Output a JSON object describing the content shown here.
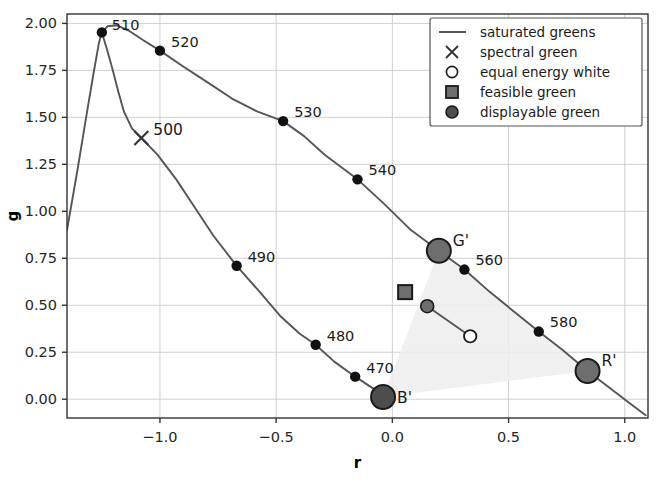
{
  "chart_data": {
    "type": "line",
    "title": "",
    "xlabel": "r",
    "ylabel": "g",
    "xlim": [
      -1.4,
      1.1
    ],
    "ylim": [
      -0.1,
      2.05
    ],
    "grid": true,
    "legend_position": "upper right",
    "xticks": [
      -1.0,
      -0.5,
      0.0,
      0.5,
      1.0
    ],
    "xtick_labels": [
      "−1.0",
      "−0.5",
      "0.0",
      "0.5",
      "1.0"
    ],
    "yticks": [
      0.0,
      0.25,
      0.5,
      0.75,
      1.0,
      1.25,
      1.5,
      1.75,
      2.0
    ],
    "ytick_labels": [
      "0.00",
      "0.25",
      "0.50",
      "0.75",
      "1.00",
      "1.25",
      "1.50",
      "1.75",
      "2.00"
    ],
    "series": [
      {
        "name": "saturated greens",
        "type": "line",
        "color": "#555555",
        "points": [
          [
            -1.4,
            0.9
          ],
          [
            -1.355,
            1.22
          ],
          [
            -1.315,
            1.52
          ],
          [
            -1.285,
            1.74
          ],
          [
            -1.262,
            1.9
          ],
          [
            -1.25,
            1.952
          ],
          [
            -1.225,
            1.985
          ],
          [
            -1.185,
            1.99
          ],
          [
            -1.135,
            1.962
          ],
          [
            -1.075,
            1.913
          ],
          [
            -1.0,
            1.855
          ],
          [
            -0.905,
            1.775
          ],
          [
            -0.8,
            1.69
          ],
          [
            -0.69,
            1.6
          ],
          [
            -0.58,
            1.53
          ],
          [
            -0.47,
            1.48
          ],
          [
            -0.38,
            1.4
          ],
          [
            -0.29,
            1.3
          ],
          [
            -0.215,
            1.23
          ],
          [
            -0.15,
            1.17
          ],
          [
            -0.04,
            1.045
          ],
          [
            0.08,
            0.9
          ],
          [
            0.2,
            0.79
          ],
          [
            0.31,
            0.69
          ],
          [
            0.42,
            0.57
          ],
          [
            0.52,
            0.47
          ],
          [
            0.63,
            0.36
          ],
          [
            0.73,
            0.265
          ],
          [
            0.84,
            0.15
          ],
          [
            0.93,
            0.065
          ],
          [
            1.02,
            -0.02
          ],
          [
            1.09,
            -0.085
          ]
        ]
      },
      {
        "name": "spectral-locus-lower",
        "type": "line",
        "color": "#555555",
        "points": [
          [
            -1.25,
            1.952
          ],
          [
            -1.23,
            1.87
          ],
          [
            -1.205,
            1.76
          ],
          [
            -1.18,
            1.64
          ],
          [
            -1.155,
            1.53
          ],
          [
            -1.12,
            1.44
          ],
          [
            -1.08,
            1.39
          ],
          [
            -1.01,
            1.3
          ],
          [
            -0.93,
            1.17
          ],
          [
            -0.85,
            1.02
          ],
          [
            -0.77,
            0.87
          ],
          [
            -0.67,
            0.71
          ],
          [
            -0.57,
            0.57
          ],
          [
            -0.48,
            0.44
          ],
          [
            -0.4,
            0.35
          ],
          [
            -0.33,
            0.29
          ],
          [
            -0.25,
            0.2
          ],
          [
            -0.16,
            0.12
          ],
          [
            -0.08,
            0.055
          ],
          [
            -0.04,
            0.012
          ]
        ]
      },
      {
        "name": "white-connector",
        "type": "line",
        "color": "#555555",
        "points": [
          [
            0.15,
            0.495
          ],
          [
            0.335,
            0.335
          ]
        ]
      }
    ],
    "spectral_points": [
      {
        "label": "510",
        "r": -1.25,
        "g": 1.952,
        "label_dx": 10,
        "label_dy": -2
      },
      {
        "label": "520",
        "r": -1.0,
        "g": 1.855,
        "label_dx": 11,
        "label_dy": -4
      },
      {
        "label": "530",
        "r": -0.47,
        "g": 1.48,
        "label_dx": 11,
        "label_dy": -4
      },
      {
        "label": "540",
        "r": -0.15,
        "g": 1.17,
        "label_dx": 11,
        "label_dy": -4
      },
      {
        "label": "560",
        "r": 0.31,
        "g": 0.69,
        "label_dx": 11,
        "label_dy": -5
      },
      {
        "label": "580",
        "r": 0.63,
        "g": 0.36,
        "label_dx": 11,
        "label_dy": -5
      },
      {
        "label": "490",
        "r": -0.67,
        "g": 0.71,
        "label_dx": 11,
        "label_dy": -4
      },
      {
        "label": "480",
        "r": -0.33,
        "g": 0.29,
        "label_dx": 11,
        "label_dy": -4
      },
      {
        "label": "470",
        "r": -0.16,
        "g": 0.12,
        "label_dx": 11,
        "label_dy": -4
      }
    ],
    "markers": [
      {
        "name": "spectral green",
        "kind": "x",
        "label": "500",
        "r": -1.08,
        "g": 1.39,
        "color": "#333333",
        "label_dx": 12,
        "label_dy": -3
      },
      {
        "name": "feasible green",
        "kind": "square",
        "label": "",
        "r": 0.055,
        "g": 0.57,
        "color": "#6e6e6e",
        "edge": "#1a1a1a"
      },
      {
        "name": "displayable green small",
        "kind": "circle-small",
        "label": "",
        "r": 0.15,
        "g": 0.495,
        "color": "#6e6e6e",
        "edge": "#1a1a1a"
      },
      {
        "name": "equal energy white",
        "kind": "circle-open",
        "label": "",
        "r": 0.335,
        "g": 0.335,
        "color": "#ffffff",
        "edge": "#1a1a1a"
      },
      {
        "name": "primary G",
        "kind": "circle-big",
        "label": "G'",
        "r": 0.2,
        "g": 0.79,
        "color": "#6e6e6e",
        "edge": "#1a1a1a",
        "label_dx": 14,
        "label_dy": -5
      },
      {
        "name": "primary R",
        "kind": "circle-big",
        "label": "R'",
        "r": 0.84,
        "g": 0.15,
        "color": "#6e6e6e",
        "edge": "#1a1a1a",
        "label_dx": 14,
        "label_dy": -5
      },
      {
        "name": "primary B",
        "kind": "circle-big",
        "label": "B'",
        "r": -0.04,
        "g": 0.012,
        "color": "#4d4d4d",
        "edge": "#1a1a1a",
        "label_dx": 14,
        "label_dy": 6
      }
    ],
    "gamut_triangle": {
      "name": "display gamut",
      "vertices": [
        [
          0.2,
          0.79
        ],
        [
          0.84,
          0.15
        ],
        [
          -0.04,
          0.012
        ]
      ],
      "fill": "#ededed",
      "opacity": 0.85
    },
    "annotations": []
  },
  "legend": {
    "entries": [
      {
        "label": "saturated greens",
        "marker": "line",
        "color": "#555555"
      },
      {
        "label": "spectral green",
        "marker": "x",
        "color": "#333333"
      },
      {
        "label": "equal energy white",
        "marker": "circle-open",
        "color": "#ffffff"
      },
      {
        "label": "feasible green",
        "marker": "square",
        "color": "#6e6e6e"
      },
      {
        "label": "displayable green",
        "marker": "circle-filled",
        "color": "#4d4d4d"
      }
    ]
  },
  "style": {
    "grid_color": "#d0d0d0",
    "axis_color": "#333333",
    "text_color": "#262626",
    "background": "#ffffff"
  }
}
